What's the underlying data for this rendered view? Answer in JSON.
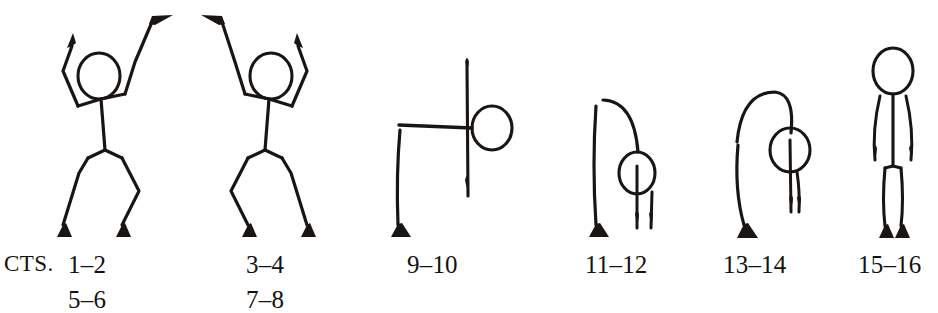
{
  "page": {
    "kind": "dance-notation-figure-row",
    "background_color": "#ffffff",
    "ink_color": "#191512",
    "width": 938,
    "height": 313
  },
  "captions": {
    "prefix_label": "CTS.",
    "entries": [
      {
        "id": "counts-1-2",
        "line1": "1–2",
        "line2": "5–6"
      },
      {
        "id": "counts-3-4",
        "line1": "3–4",
        "line2": "7–8"
      },
      {
        "id": "counts-9-10",
        "line1": "9–10",
        "line2": ""
      },
      {
        "id": "counts-11-12",
        "line1": "11–12",
        "line2": ""
      },
      {
        "id": "counts-13-14",
        "line1": "13–14",
        "line2": ""
      },
      {
        "id": "counts-15-16",
        "line1": "15–16",
        "line2": ""
      }
    ]
  },
  "figures": [
    {
      "id": "figure-1",
      "name": "arms-overhead-lunge-left",
      "counts": "1–2 / 5–6",
      "head": {
        "cx": 99,
        "cy": 76,
        "rx": 21,
        "ry": 23
      },
      "description": "Standing figure, both arms raised overhead with bent elbows, weight shifted with bent knees and pointed feet"
    },
    {
      "id": "figure-2",
      "name": "arms-overhead-lunge-right",
      "counts": "3–4 / 7–8",
      "head": {
        "cx": 271,
        "cy": 76,
        "rx": 21,
        "ry": 23
      },
      "description": "Mirror of figure one, both arms raised overhead, opposite weight shift"
    },
    {
      "id": "figure-3",
      "name": "cross-pose-horizontal-arms",
      "counts": "9–10",
      "head": {
        "cx": 492,
        "cy": 128,
        "rx": 20,
        "ry": 22
      },
      "description": "Cross shaped pose, body axis vertical with horizontal arm bar, head at right, one straight leg down-left"
    },
    {
      "id": "figure-4",
      "name": "bent-over-curved-arm-low",
      "counts": "11–12",
      "head": {
        "cx": 637,
        "cy": 173,
        "rx": 18,
        "ry": 21
      },
      "description": "Figure bending forward, one curved arm arcing over the head, two legs close together"
    },
    {
      "id": "figure-5",
      "name": "bent-over-curved-arm-high",
      "counts": "13–14",
      "head": {
        "cx": 790,
        "cy": 150,
        "rx": 20,
        "ry": 22
      },
      "description": "Figure arching forward with a tall curved arm arc over the head, two legs close together"
    },
    {
      "id": "figure-6",
      "name": "standing-neutral",
      "counts": "15–16",
      "head": {
        "cx": 893,
        "cy": 71,
        "rx": 20,
        "ry": 23
      },
      "description": "Upright standing figure, arms hanging at sides, legs together with pointed feet"
    }
  ]
}
